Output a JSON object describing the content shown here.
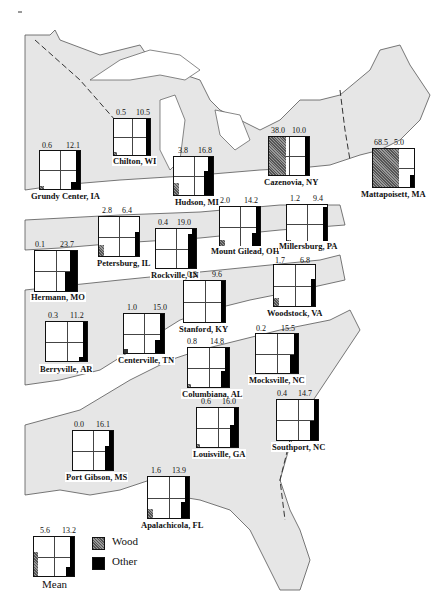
{
  "map": {
    "region": "Eastern United States",
    "land_color": "#e6e6e6",
    "zone_boundary_style": "solid and dashed lines"
  },
  "legend": {
    "items": [
      {
        "label": "Wood",
        "color": "#777777",
        "pattern": "stippled"
      },
      {
        "label": "Other",
        "color": "#000000",
        "pattern": "solid"
      }
    ]
  },
  "sites": [
    {
      "name": "Chilton, WI",
      "wood": "0.5",
      "other": "10.5"
    },
    {
      "name": "Grundy Center, IA",
      "wood": "0.6",
      "other": "12.1"
    },
    {
      "name": "Hudson, MI",
      "wood": "3.8",
      "other": "16.8"
    },
    {
      "name": "Cazenovia, NY",
      "wood": "38.0",
      "other": "10.0"
    },
    {
      "name": "Mattapoisett, MA",
      "wood": "68.5",
      "other": "5.0"
    },
    {
      "name": "Petersburg, IL",
      "wood": "2.8",
      "other": "6.4"
    },
    {
      "name": "Rockville, IN",
      "wood": "0.4",
      "other": "19.0"
    },
    {
      "name": "Mount Gilead, OH",
      "wood": "2.0",
      "other": "14.2"
    },
    {
      "name": "Millersburg, PA",
      "wood": "1.2",
      "other": "9.4"
    },
    {
      "name": "Hermann, MO",
      "wood": "0.1",
      "other": "23.7"
    },
    {
      "name": "Woodstock, VA",
      "wood": "1.7",
      "other": "6.8"
    },
    {
      "name": "Stanford, KY",
      "wood": "0.2",
      "other": "9.6"
    },
    {
      "name": "Berryville, AR",
      "wood": "0.3",
      "other": "11.2"
    },
    {
      "name": "Centerville, TN",
      "wood": "1.0",
      "other": "15.0"
    },
    {
      "name": "Columbiana, AL",
      "wood": "0.8",
      "other": "14.8"
    },
    {
      "name": "Mocksville, NC",
      "wood": "0.2",
      "other": "15.5"
    },
    {
      "name": "Louisville, GA",
      "wood": "0.6",
      "other": "16.0"
    },
    {
      "name": "Southport, NC",
      "wood": "0.4",
      "other": "14.7"
    },
    {
      "name": "Port Gibson, MS",
      "wood": "0.0",
      "other": "16.1"
    },
    {
      "name": "Apalachicola, FL",
      "wood": "1.6",
      "other": "13.9"
    },
    {
      "name": "Mean",
      "wood": "5.6",
      "other": "13.2"
    }
  ]
}
